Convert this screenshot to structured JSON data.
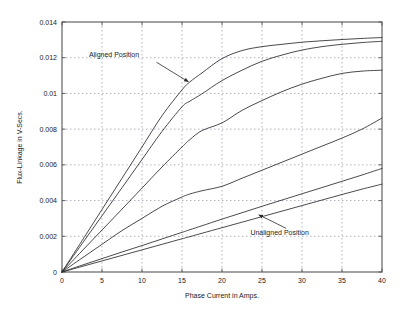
{
  "chart_data": {
    "type": "line",
    "title": "",
    "xlabel": "Phase Current in Amps.",
    "ylabel": "Flux-Linkage in V-Secs.",
    "xlim": [
      0,
      40
    ],
    "ylim": [
      0,
      0.014
    ],
    "grid": true,
    "legend_position": "none",
    "xticks": [
      "0",
      "5",
      "10",
      "15",
      "20",
      "25",
      "30",
      "35",
      "40"
    ],
    "xtick_values": [
      0,
      5,
      10,
      15,
      20,
      25,
      30,
      35,
      40
    ],
    "yticks": [
      "0",
      "0.002",
      "0.004",
      "0.006",
      "0.008",
      "0.01",
      "0.012",
      "0.014"
    ],
    "ytick_values": [
      0,
      0.002,
      0.004,
      0.006,
      0.008,
      0.01,
      0.012,
      0.014
    ],
    "x": [
      0,
      2.5,
      5,
      7.5,
      10,
      12.5,
      15,
      16,
      17.5,
      20,
      22.5,
      25,
      27.5,
      30,
      32.5,
      35,
      37.5,
      40
    ],
    "series": [
      {
        "name": "Aligned Position",
        "values": [
          0,
          0.00175,
          0.0035,
          0.00525,
          0.007,
          0.00875,
          0.0102,
          0.01065,
          0.01115,
          0.01195,
          0.0124,
          0.01262,
          0.01275,
          0.01287,
          0.01295,
          0.01302,
          0.01308,
          0.01313
        ]
      },
      {
        "name": "Rotor position 2",
        "values": [
          0,
          0.00158,
          0.00315,
          0.00472,
          0.0063,
          0.00787,
          0.00925,
          0.00957,
          0.00998,
          0.01072,
          0.0113,
          0.0118,
          0.01215,
          0.01243,
          0.01262,
          0.01275,
          0.01285,
          0.01292
        ]
      },
      {
        "name": "Rotor position 3",
        "values": [
          0,
          0.00118,
          0.00235,
          0.00352,
          0.0047,
          0.00588,
          0.007,
          0.00742,
          0.00792,
          0.00835,
          0.00905,
          0.0096,
          0.0101,
          0.01052,
          0.01085,
          0.01112,
          0.01125,
          0.0113
        ]
      },
      {
        "name": "Rotor position 4",
        "values": [
          0,
          0.00078,
          0.00155,
          0.00232,
          0.003,
          0.00368,
          0.0042,
          0.00437,
          0.00455,
          0.0048,
          0.00525,
          0.0057,
          0.00615,
          0.0066,
          0.00705,
          0.0075,
          0.008,
          0.00862
        ]
      },
      {
        "name": "Rotor position 5",
        "values": [
          0,
          0.00038,
          0.00075,
          0.00112,
          0.00148,
          0.00185,
          0.00222,
          0.00237,
          0.00259,
          0.00296,
          0.00332,
          0.00368,
          0.00403,
          0.00438,
          0.00473,
          0.00508,
          0.00543,
          0.0058
        ]
      },
      {
        "name": "Unaligned Position",
        "values": [
          0,
          0.00031,
          0.00062,
          0.00093,
          0.00124,
          0.00155,
          0.00186,
          0.00198,
          0.00217,
          0.00248,
          0.00279,
          0.0031,
          0.00341,
          0.00372,
          0.00403,
          0.00434,
          0.00464,
          0.00492
        ]
      }
    ],
    "annotations": [
      {
        "text": "Aligned Position",
        "text_x": 6.5,
        "text_y": 0.01205,
        "arrow_from_x": 11.8,
        "arrow_from_y": 0.01175,
        "arrow_to_x": 15.8,
        "arrow_to_y": 0.01065
      },
      {
        "text": "Unaligned Position",
        "text_x": 27.2,
        "text_y": 0.00205,
        "arrow_from_x": 28.0,
        "arrow_from_y": 0.00245,
        "arrow_to_x": 24.6,
        "arrow_to_y": 0.0032
      }
    ],
    "colors": {
      "axis": "#555555",
      "grid": "#7d7d9e",
      "curve": "#2b2b2b",
      "background": "#ffffff"
    }
  }
}
